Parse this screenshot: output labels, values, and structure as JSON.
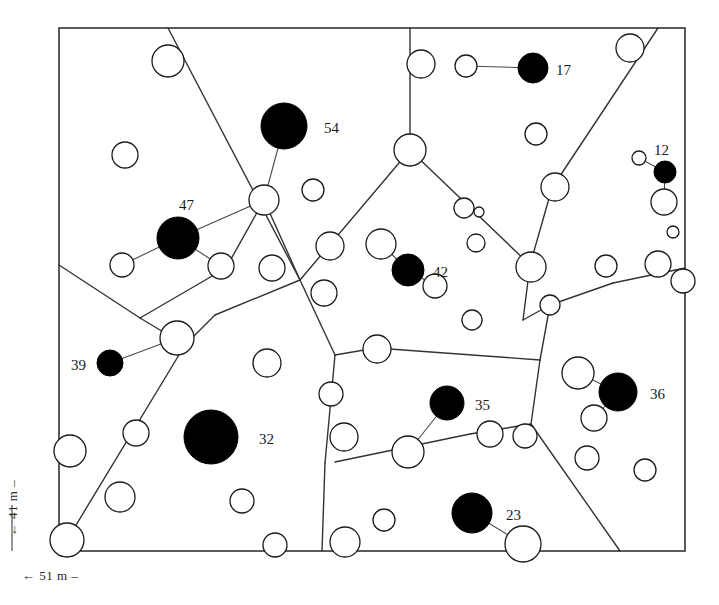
{
  "figure": {
    "type": "voronoi-tessellation-point-map",
    "frame": {
      "x": 59,
      "y": 28,
      "width": 626,
      "height": 523,
      "stroke": "#333333"
    },
    "scale_bars": {
      "horizontal_label": "← 51 m –",
      "vertical_label": "← 41 m –"
    },
    "colors": {
      "filled": "#000000",
      "open_stroke": "#1a1a1a",
      "open_fill": "#ffffff",
      "cell_edge": "#333333",
      "link": "#4a4a4a",
      "label_text": "#1a1a1a"
    }
  },
  "chart_data": {
    "type": "scatter",
    "title": "",
    "xlabel": "",
    "ylabel": "",
    "grid": false,
    "legend": null,
    "labelled_points": [
      {
        "label": "17",
        "x": 533,
        "y": 68,
        "r": 15,
        "fill": "solid",
        "label_dx": 22,
        "label_dy": 4
      },
      {
        "label": "54",
        "x": 284,
        "y": 126,
        "r": 23,
        "fill": "solid",
        "label_dx": 31,
        "label_dy": 4
      },
      {
        "label": "12",
        "x": 665,
        "y": 172,
        "r": 11,
        "fill": "solid",
        "label_dx": -8,
        "label_dy": -20
      },
      {
        "label": "47",
        "x": 178,
        "y": 238,
        "r": 21,
        "fill": "solid",
        "label_dx": -6,
        "label_dy": -31
      },
      {
        "label": "42",
        "x": 408,
        "y": 270,
        "r": 16,
        "fill": "solid",
        "label_dx": 23,
        "label_dy": 4
      },
      {
        "label": "39",
        "x": 110,
        "y": 363,
        "r": 13,
        "fill": "solid",
        "label_dx": -38,
        "label_dy": 4
      },
      {
        "label": "36",
        "x": 618,
        "y": 392,
        "r": 19,
        "fill": "solid",
        "label_dx": 27,
        "label_dy": 4
      },
      {
        "label": "35",
        "x": 447,
        "y": 403,
        "r": 17,
        "fill": "solid",
        "label_dx": 25,
        "label_dy": 4
      },
      {
        "label": "32",
        "x": 211,
        "y": 437,
        "r": 27,
        "fill": "solid",
        "label_dx": 35,
        "label_dy": 4
      },
      {
        "label": "23",
        "x": 472,
        "y": 513,
        "r": 20,
        "fill": "solid",
        "label_dx": 28,
        "label_dy": 4
      }
    ],
    "open_points": [
      {
        "x": 168,
        "y": 61,
        "r": 16
      },
      {
        "x": 421,
        "y": 64,
        "r": 14
      },
      {
        "x": 466,
        "y": 66,
        "r": 11
      },
      {
        "x": 630,
        "y": 48,
        "r": 14
      },
      {
        "x": 536,
        "y": 134,
        "r": 11
      },
      {
        "x": 410,
        "y": 150,
        "r": 16
      },
      {
        "x": 125,
        "y": 155,
        "r": 13
      },
      {
        "x": 264,
        "y": 200,
        "r": 15
      },
      {
        "x": 313,
        "y": 190,
        "r": 11
      },
      {
        "x": 555,
        "y": 187,
        "r": 14
      },
      {
        "x": 639,
        "y": 158,
        "r": 7
      },
      {
        "x": 664,
        "y": 202,
        "r": 13
      },
      {
        "x": 464,
        "y": 208,
        "r": 10
      },
      {
        "x": 479,
        "y": 212,
        "r": 5
      },
      {
        "x": 476,
        "y": 243,
        "r": 9
      },
      {
        "x": 122,
        "y": 265,
        "r": 12
      },
      {
        "x": 221,
        "y": 266,
        "r": 13
      },
      {
        "x": 272,
        "y": 268,
        "r": 13
      },
      {
        "x": 330,
        "y": 246,
        "r": 14
      },
      {
        "x": 381,
        "y": 244,
        "r": 15
      },
      {
        "x": 673,
        "y": 232,
        "r": 6
      },
      {
        "x": 658,
        "y": 264,
        "r": 13
      },
      {
        "x": 606,
        "y": 266,
        "r": 11
      },
      {
        "x": 531,
        "y": 267,
        "r": 15
      },
      {
        "x": 324,
        "y": 293,
        "r": 13
      },
      {
        "x": 550,
        "y": 305,
        "r": 10
      },
      {
        "x": 435,
        "y": 286,
        "r": 12
      },
      {
        "x": 177,
        "y": 338,
        "r": 17
      },
      {
        "x": 267,
        "y": 363,
        "r": 14
      },
      {
        "x": 377,
        "y": 349,
        "r": 14
      },
      {
        "x": 578,
        "y": 373,
        "r": 16
      },
      {
        "x": 70,
        "y": 451,
        "r": 16
      },
      {
        "x": 136,
        "y": 433,
        "r": 13
      },
      {
        "x": 120,
        "y": 497,
        "r": 15
      },
      {
        "x": 242,
        "y": 501,
        "r": 12
      },
      {
        "x": 344,
        "y": 437,
        "r": 14
      },
      {
        "x": 331,
        "y": 394,
        "r": 12
      },
      {
        "x": 408,
        "y": 452,
        "r": 16
      },
      {
        "x": 490,
        "y": 434,
        "r": 13
      },
      {
        "x": 525,
        "y": 436,
        "r": 12
      },
      {
        "x": 594,
        "y": 418,
        "r": 13
      },
      {
        "x": 587,
        "y": 458,
        "r": 12
      },
      {
        "x": 67,
        "y": 540,
        "r": 17
      },
      {
        "x": 275,
        "y": 545,
        "r": 12
      },
      {
        "x": 345,
        "y": 542,
        "r": 15
      },
      {
        "x": 384,
        "y": 520,
        "r": 11
      },
      {
        "x": 523,
        "y": 544,
        "r": 18
      },
      {
        "x": 472,
        "y": 320,
        "r": 10
      },
      {
        "x": 645,
        "y": 470,
        "r": 11
      },
      {
        "x": 683,
        "y": 281,
        "r": 12
      }
    ],
    "links": [
      {
        "from": [
          466,
          66
        ],
        "to": [
          533,
          68
        ]
      },
      {
        "from": [
          284,
          126
        ],
        "to": [
          264,
          200
        ]
      },
      {
        "from": [
          264,
          200
        ],
        "to": [
          178,
          238
        ]
      },
      {
        "from": [
          178,
          238
        ],
        "to": [
          122,
          265
        ]
      },
      {
        "from": [
          178,
          238
        ],
        "to": [
          221,
          266
        ]
      },
      {
        "from": [
          639,
          158
        ],
        "to": [
          665,
          172
        ]
      },
      {
        "from": [
          665,
          172
        ],
        "to": [
          664,
          202
        ]
      },
      {
        "from": [
          381,
          244
        ],
        "to": [
          408,
          270
        ]
      },
      {
        "from": [
          408,
          270
        ],
        "to": [
          435,
          286
        ]
      },
      {
        "from": [
          110,
          363
        ],
        "to": [
          177,
          338
        ]
      },
      {
        "from": [
          578,
          373
        ],
        "to": [
          618,
          392
        ]
      },
      {
        "from": [
          618,
          392
        ],
        "to": [
          594,
          418
        ]
      },
      {
        "from": [
          447,
          403
        ],
        "to": [
          408,
          452
        ]
      },
      {
        "from": [
          472,
          513
        ],
        "to": [
          523,
          544
        ]
      }
    ],
    "cell_edges": [
      [
        [
          168,
          28
        ],
        [
          300,
          280
        ]
      ],
      [
        [
          300,
          280
        ],
        [
          264,
          200
        ]
      ],
      [
        [
          264,
          200
        ],
        [
          226,
          268
        ]
      ],
      [
        [
          226,
          268
        ],
        [
          140,
          318
        ]
      ],
      [
        [
          140,
          318
        ],
        [
          59,
          265
        ]
      ],
      [
        [
          140,
          318
        ],
        [
          185,
          345
        ]
      ],
      [
        [
          185,
          345
        ],
        [
          67,
          540
        ]
      ],
      [
        [
          185,
          345
        ],
        [
          215,
          315
        ]
      ],
      [
        [
          215,
          315
        ],
        [
          300,
          280
        ]
      ],
      [
        [
          300,
          280
        ],
        [
          335,
          355
        ]
      ],
      [
        [
          335,
          355
        ],
        [
          325,
          463
        ]
      ],
      [
        [
          325,
          463
        ],
        [
          322,
          551
        ]
      ],
      [
        [
          410,
          28
        ],
        [
          410,
          150
        ]
      ],
      [
        [
          410,
          150
        ],
        [
          300,
          280
        ]
      ],
      [
        [
          410,
          150
        ],
        [
          530,
          265
        ]
      ],
      [
        [
          530,
          265
        ],
        [
          552,
          188
        ]
      ],
      [
        [
          552,
          188
        ],
        [
          658,
          28
        ]
      ],
      [
        [
          530,
          265
        ],
        [
          523,
          320
        ]
      ],
      [
        [
          523,
          320
        ],
        [
          550,
          305
        ]
      ],
      [
        [
          550,
          305
        ],
        [
          613,
          283
        ]
      ],
      [
        [
          613,
          283
        ],
        [
          685,
          268
        ]
      ],
      [
        [
          550,
          305
        ],
        [
          540,
          360
        ]
      ],
      [
        [
          540,
          360
        ],
        [
          531,
          424
        ]
      ],
      [
        [
          531,
          424
        ],
        [
          620,
          551
        ]
      ],
      [
        [
          531,
          424
        ],
        [
          470,
          434
        ]
      ],
      [
        [
          470,
          434
        ],
        [
          335,
          462
        ]
      ],
      [
        [
          335,
          355
        ],
        [
          376,
          348
        ]
      ],
      [
        [
          376,
          348
        ],
        [
          540,
          360
        ]
      ]
    ]
  }
}
